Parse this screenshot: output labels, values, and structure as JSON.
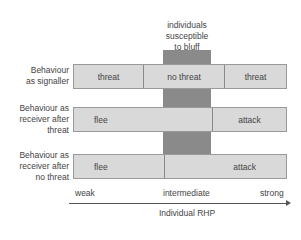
{
  "title_label": "individuals\nsusceptible\nto bluff",
  "rows": [
    {
      "label": "Behaviour\nas signaller",
      "segments": [
        "threat",
        "no threat",
        "threat"
      ]
    },
    {
      "label": "Behaviour as\nreceiver after\nthreat",
      "segments": [
        "flee",
        "attack"
      ]
    },
    {
      "label": "Behaviour as\nreceiver after\nno threat",
      "segments": [
        "flee",
        "attack"
      ]
    }
  ],
  "axis": {
    "ticks": [
      "weak",
      "intermediate",
      "strong"
    ],
    "title": "Individual RHP"
  },
  "colors": {
    "box_fill": "#d9d9d9",
    "highlight_column": "#8a8a8a",
    "border": "#9a9a9a",
    "text": "#444444"
  }
}
